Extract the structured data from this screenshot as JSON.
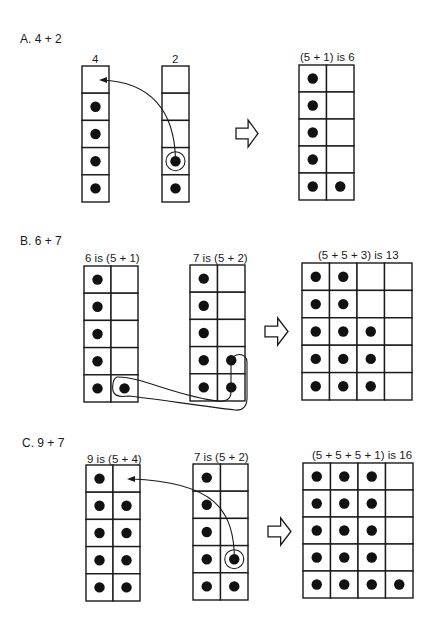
{
  "sections": [
    {
      "id": "A",
      "title": "A.  4 + 2",
      "title_pos": [
        20,
        33
      ],
      "grids": [
        {
          "name": "addend-1-grid",
          "label": "4",
          "label_pos": [
            92,
            54
          ],
          "x": 82,
          "y": 66,
          "cols": 1,
          "rows": 5,
          "cw": 27,
          "ch": 27.2,
          "dots": [
            [
              0,
              1
            ],
            [
              0,
              2
            ],
            [
              0,
              3
            ],
            [
              0,
              4
            ]
          ],
          "ring": []
        },
        {
          "name": "addend-2-grid",
          "label": "2",
          "label_pos": [
            172,
            54
          ],
          "x": 162,
          "y": 66,
          "cols": 1,
          "rows": 5,
          "cw": 27,
          "ch": 27.2,
          "dots": [
            [
              0,
              3
            ],
            [
              0,
              4
            ]
          ],
          "ring": [
            [
              0,
              3
            ]
          ]
        },
        {
          "name": "result-grid",
          "label": "(5 + 1) is 6",
          "label_pos": [
            300,
            52
          ],
          "x": 299,
          "y": 65,
          "cols": 2,
          "rows": 5,
          "cw": 27.5,
          "ch": 27,
          "dots": [
            [
              0,
              0
            ],
            [
              0,
              1
            ],
            [
              0,
              2
            ],
            [
              0,
              3
            ],
            [
              0,
              4
            ],
            [
              1,
              4
            ]
          ],
          "ring": []
        }
      ],
      "move_arrow": {
        "path": "M 175.5 161 C 175 110, 150 82, 102 80",
        "head": [
          99,
          80
        ]
      },
      "big_arrow": {
        "x": 236,
        "y": 120,
        "w": 22,
        "h": 27
      }
    },
    {
      "id": "B",
      "title": "B.  6 + 7",
      "title_pos": [
        20,
        235
      ],
      "grids": [
        {
          "name": "addend-1-grid",
          "label": "6 is (5 + 1)",
          "label_pos": [
            85,
            253
          ],
          "x": 84,
          "y": 266,
          "cols": 2,
          "rows": 5,
          "cw": 27,
          "ch": 27.2,
          "dots": [
            [
              0,
              0
            ],
            [
              0,
              1
            ],
            [
              0,
              2
            ],
            [
              0,
              3
            ],
            [
              0,
              4
            ],
            [
              1,
              4
            ]
          ],
          "ring": []
        },
        {
          "name": "addend-2-grid",
          "label": "7 is (5 + 2)",
          "label_pos": [
            193,
            253
          ],
          "x": 190,
          "y": 265,
          "cols": 2,
          "rows": 5,
          "cw": 27.5,
          "ch": 27.2,
          "dots": [
            [
              0,
              0
            ],
            [
              0,
              1
            ],
            [
              0,
              2
            ],
            [
              0,
              3
            ],
            [
              0,
              4
            ],
            [
              1,
              3
            ],
            [
              1,
              4
            ]
          ],
          "ring": []
        },
        {
          "name": "result-grid",
          "label": "(5 + 5 + 3) is 13",
          "label_pos": [
            318,
            250
          ],
          "x": 302,
          "y": 263,
          "cols": 4,
          "rows": 5,
          "cw": 27.5,
          "ch": 27.4,
          "dots": [
            [
              0,
              0
            ],
            [
              1,
              0
            ],
            [
              0,
              1
            ],
            [
              1,
              1
            ],
            [
              0,
              2
            ],
            [
              1,
              2
            ],
            [
              2,
              2
            ],
            [
              0,
              3
            ],
            [
              1,
              3
            ],
            [
              2,
              3
            ],
            [
              0,
              4
            ],
            [
              1,
              4
            ],
            [
              2,
              4
            ]
          ],
          "ring": []
        }
      ],
      "loop_path": "M 118 377 C 113 377, 112 386, 113 391 C 115 397, 122 397, 128 396 C 150 398, 200 406, 235 410 C 243 411, 247 406, 247 398 L 247 362 C 247 352, 232 352, 231 362 L 231 392 C 231 399, 226 402, 218 401 C 190 398, 160 386, 138 380 C 130 378, 124 377, 118 377 Z",
      "big_arrow": {
        "x": 265,
        "y": 318,
        "w": 23,
        "h": 27
      }
    },
    {
      "id": "C",
      "title": "C.  9 + 7",
      "title_pos": [
        22,
        437
      ],
      "grids": [
        {
          "name": "addend-1-grid",
          "label": "9 is (5 + 4)",
          "label_pos": [
            87,
            454
          ],
          "x": 86,
          "y": 465,
          "cols": 2,
          "rows": 5,
          "cw": 27,
          "ch": 27.2,
          "dots": [
            [
              0,
              0
            ],
            [
              0,
              1
            ],
            [
              1,
              1
            ],
            [
              0,
              2
            ],
            [
              1,
              2
            ],
            [
              0,
              3
            ],
            [
              1,
              3
            ],
            [
              0,
              4
            ],
            [
              1,
              4
            ]
          ],
          "ring": []
        },
        {
          "name": "addend-2-grid",
          "label": "7 is (5 + 2)",
          "label_pos": [
            194,
            452
          ],
          "x": 193,
          "y": 464,
          "cols": 2,
          "rows": 5,
          "cw": 27.5,
          "ch": 27.2,
          "dots": [
            [
              0,
              0
            ],
            [
              0,
              1
            ],
            [
              0,
              2
            ],
            [
              0,
              3
            ],
            [
              0,
              4
            ],
            [
              1,
              3
            ],
            [
              1,
              4
            ]
          ],
          "ring": [
            [
              1,
              3
            ]
          ]
        },
        {
          "name": "result-grid",
          "label": "(5 + 5 + 5 + 1) is 16",
          "label_pos": [
            312,
            450
          ],
          "x": 303,
          "y": 463,
          "cols": 4,
          "rows": 5,
          "cw": 27.5,
          "ch": 27,
          "dots": [
            [
              0,
              0
            ],
            [
              1,
              0
            ],
            [
              2,
              0
            ],
            [
              0,
              1
            ],
            [
              1,
              1
            ],
            [
              2,
              1
            ],
            [
              0,
              2
            ],
            [
              1,
              2
            ],
            [
              2,
              2
            ],
            [
              0,
              3
            ],
            [
              1,
              3
            ],
            [
              2,
              3
            ],
            [
              0,
              4
            ],
            [
              1,
              4
            ],
            [
              2,
              4
            ],
            [
              3,
              4
            ]
          ],
          "ring": []
        }
      ],
      "move_arrow": {
        "path": "M 234.5 560 C 234 510, 215 482, 131 479",
        "head": [
          127,
          479
        ]
      },
      "big_arrow": {
        "x": 268,
        "y": 518,
        "w": 23,
        "h": 27
      }
    }
  ],
  "colors": {
    "ink": "#1a1a1a",
    "dot": "#111111",
    "background": "#ffffff"
  }
}
